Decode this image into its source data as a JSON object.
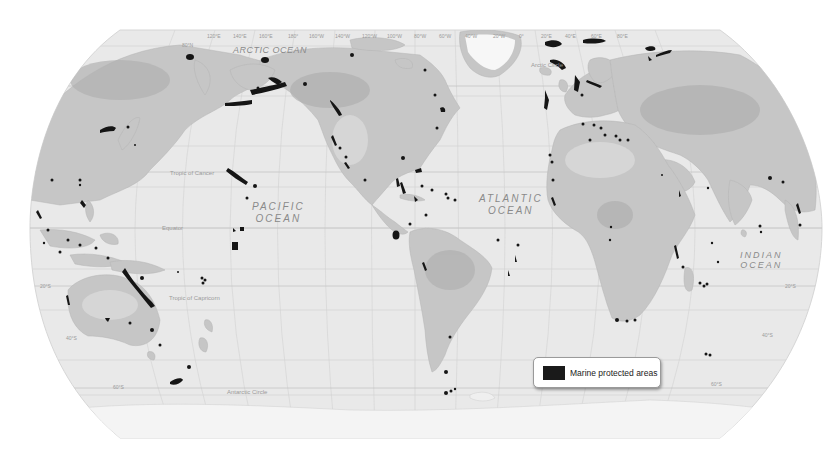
{
  "map": {
    "projection": "Robinson",
    "style": "grayscale shaded relief",
    "colors": {
      "background": "#ffffff",
      "ocean": "#e9e9e9",
      "land": "#c4c4c4",
      "land_dark": "#a9a9a9",
      "ice": "#f6f6f6",
      "graticule": "#cfcfcf",
      "mpa": "#151515"
    },
    "ocean_labels": {
      "arctic": "ARCTIC OCEAN",
      "pacific_line1": "PACIFIC",
      "pacific_line2": "OCEAN",
      "atlantic_line1": "ATLANTIC",
      "atlantic_line2": "OCEAN",
      "indian_line1": "INDIAN",
      "indian_line2": "OCEAN"
    },
    "reference_lines": {
      "arctic_circle": "Arctic Circle",
      "tropic_of_cancer": "Tropic of Cancer",
      "equator": "Equator",
      "tropic_of_capricorn": "Tropic of Capricorn",
      "antarctic_circle": "Antarctic Circle"
    },
    "longitude_ticks": [
      "120°E",
      "140°E",
      "160°E",
      "180°",
      "160°W",
      "140°W",
      "120°W",
      "100°W",
      "80°W",
      "60°W",
      "40°W",
      "20°W",
      "0°",
      "20°E",
      "40°E",
      "60°E",
      "80°E"
    ],
    "latitude_ticks": {
      "n80": "80°N",
      "s20_left": "20°S",
      "s40_left": "40°S",
      "s60_left": "60°S",
      "s20_right": "20°S",
      "s40_right": "40°S",
      "s60_right": "60°S"
    }
  },
  "legend": {
    "label": "Marine protected areas",
    "swatch_color": "#151515"
  }
}
